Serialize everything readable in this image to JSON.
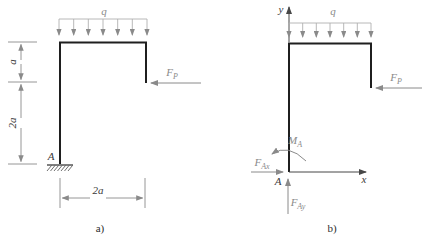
{
  "figures": {
    "a": {
      "caption": "a)",
      "distributed_load_label": "q",
      "applied_force": {
        "base": "F",
        "sub": "P"
      },
      "support_point_label": "A",
      "dimensions": {
        "left_upper": "a",
        "left_lower": "2a",
        "bottom": "2a"
      }
    },
    "b": {
      "caption": "b)",
      "distributed_load_label": "q",
      "applied_force": {
        "base": "F",
        "sub": "P"
      },
      "origin_point_label": "A",
      "axes": {
        "x": "x",
        "y": "y"
      },
      "reactions": {
        "horizontal": {
          "base": "F",
          "sub": "Ax"
        },
        "vertical": {
          "base": "F",
          "sub": "Ay"
        },
        "moment": {
          "base": "M",
          "sub": "A"
        }
      }
    }
  },
  "colors": {
    "frame": "#1f1f1f",
    "annotation_gray": "#8a8a8a",
    "light_gray": "#b5b5b5",
    "text_dark": "#3a3a3a",
    "background": "#ffffff"
  }
}
